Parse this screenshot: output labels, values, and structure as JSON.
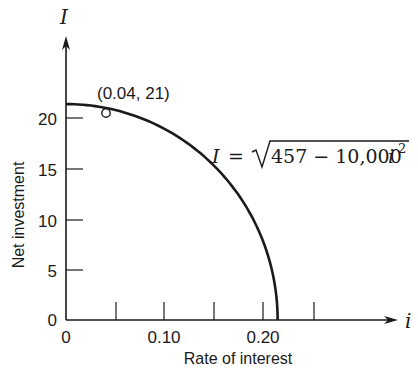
{
  "chart_data": {
    "type": "line",
    "title": "",
    "xlabel": "Rate of interest",
    "ylabel": "Net investment",
    "x_axis_symbol": "i",
    "y_axis_symbol": "I",
    "xlim": [
      0,
      0.3
    ],
    "ylim": [
      0,
      24
    ],
    "x_ticks": [
      0,
      0.05,
      0.1,
      0.15,
      0.2,
      0.25
    ],
    "x_tick_labels": [
      "0",
      "",
      "0.10",
      "",
      "0.20",
      ""
    ],
    "y_ticks": [
      0,
      5,
      10,
      15,
      20
    ],
    "y_tick_labels": [
      "0",
      "5",
      "10",
      "15",
      "20"
    ],
    "grid": false,
    "series": [
      {
        "name": "I = sqrt(457 - 10,000 i^2)",
        "equation": "I = √(457 − 10,000 i²)",
        "x": [
          0,
          0.02,
          0.04,
          0.06,
          0.08,
          0.1,
          0.12,
          0.14,
          0.16,
          0.18,
          0.2,
          0.21,
          0.2138
        ],
        "y": [
          21.38,
          21.28,
          21.0,
          20.52,
          19.82,
          18.89,
          17.69,
          16.16,
          14.18,
          11.53,
          7.55,
          4.0,
          0
        ]
      }
    ],
    "annotations": [
      {
        "text": "(0.04, 21)",
        "x": 0.04,
        "y": 21,
        "marker": "hollow-circle"
      },
      {
        "text": "I = √(457 − 10,000 i²)",
        "position": "right of curve"
      }
    ]
  },
  "labels": {
    "y_symbol": "I",
    "x_symbol": "i",
    "y_title": "Net investment",
    "x_title": "Rate of interest",
    "point_label": "(0.04, 21)",
    "eq_lhs": "I",
    "eq_equals": "=",
    "eq_radicand": "457 − 10,000",
    "eq_var": "i",
    "eq_exp": "2",
    "x_tick_0": "0",
    "x_tick_010": "0.10",
    "x_tick_020": "0.20",
    "y_tick_0": "0",
    "y_tick_5": "5",
    "y_tick_10": "10",
    "y_tick_15": "15",
    "y_tick_20": "20"
  },
  "colors": {
    "ink": "#1a1a1a",
    "background": "#ffffff"
  }
}
